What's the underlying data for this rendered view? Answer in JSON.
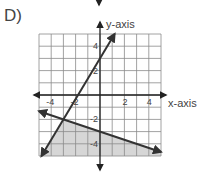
{
  "problem_label": "D)",
  "chart_data": {
    "type": "line",
    "title": "",
    "xlabel": "x-axis",
    "ylabel": "y-axis",
    "xlim": [
      -5,
      5
    ],
    "ylim": [
      -5,
      5
    ],
    "grid": true,
    "x_ticks": [
      -4,
      -2,
      2,
      4
    ],
    "y_ticks": [
      4,
      2,
      -2,
      -4
    ],
    "x_tick_labels": [
      "-4",
      "-2",
      "2",
      "4"
    ],
    "y_tick_labels": [
      "4",
      "2",
      "-2",
      "-4"
    ],
    "series": [
      {
        "name": "boundary line 1",
        "equation": "y = 5/3 x + 3",
        "style": "solid",
        "points": [
          [
            -4.8,
            -5
          ],
          [
            -3,
            -2
          ],
          [
            0,
            3
          ],
          [
            1.2,
            5
          ]
        ]
      },
      {
        "name": "boundary line 2",
        "equation": "y = -1/3 x - 3",
        "style": "solid",
        "points": [
          [
            -5,
            -1.33
          ],
          [
            -3,
            -2
          ],
          [
            0,
            -3
          ],
          [
            5,
            -4.67
          ]
        ]
      }
    ],
    "shaded_region": {
      "description": "region below line 2 and to the right of line 1",
      "vertices": [
        [
          -3,
          -2
        ],
        [
          5,
          -4.67
        ],
        [
          5,
          -5
        ],
        [
          -4.8,
          -5
        ]
      ],
      "color": "#d6d6d6"
    },
    "colors": {
      "grid": "#8a8a8a",
      "lines": "#333333",
      "axes": "#222222",
      "shade": "#d6d6d6"
    }
  }
}
